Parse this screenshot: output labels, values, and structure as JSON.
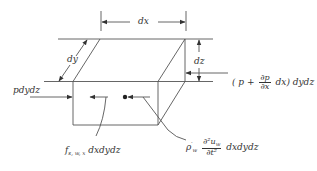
{
  "diagram": {
    "type": "free-body element",
    "labels": {
      "dx": "dx",
      "dy": "dy",
      "dz": "dz",
      "left_pressure": "pdydz",
      "right_pressure_open": "( p +",
      "right_pressure_num": "∂p",
      "right_pressure_den": "∂x",
      "right_pressure_close": "dx) dydz",
      "body_force_f": "f",
      "body_force_sub": "s, w, x",
      "body_force_rest": "dxdydz",
      "inertia_rho": "ρ",
      "inertia_rho_prime": "′",
      "inertia_rho_sub": "w",
      "inertia_num": "∂²u",
      "inertia_num_sub": "w",
      "inertia_den": "∂t²",
      "inertia_rest": "dxdydz"
    },
    "colors": {
      "line": "#555555",
      "text": "#333333",
      "background": "#ffffff"
    }
  }
}
